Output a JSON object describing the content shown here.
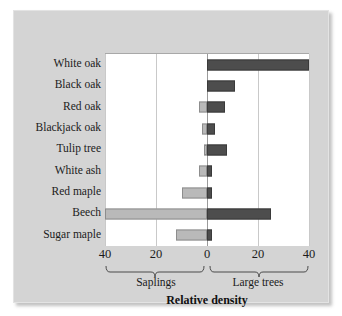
{
  "chart_data": {
    "type": "bar",
    "orientation": "horizontal",
    "subtype": "diverging-butterfly",
    "title": "",
    "xlabel": "Relative density",
    "ylabel": "",
    "xlim": [
      -40,
      40
    ],
    "grid": true,
    "legend_position": "none",
    "categories": [
      "White oak",
      "Black oak",
      "Red oak",
      "Blackjack oak",
      "Tulip tree",
      "White ash",
      "Red maple",
      "Beech",
      "Sugar maple"
    ],
    "series": [
      {
        "name": "Saplings",
        "side": "left",
        "color": "#b9b9b9",
        "values": [
          0,
          0,
          3,
          2,
          1,
          3,
          10,
          40,
          12
        ]
      },
      {
        "name": "Large trees",
        "side": "right",
        "color": "#4d4d4d",
        "values": [
          40,
          11,
          7,
          3,
          8,
          2,
          2,
          25,
          2
        ]
      }
    ],
    "x_ticks": [
      {
        "label": "40",
        "value": -40
      },
      {
        "label": "20",
        "value": -20
      },
      {
        "label": "0",
        "value": 0
      },
      {
        "label": "20",
        "value": 20
      },
      {
        "label": "40",
        "value": 40
      }
    ],
    "group_braces": [
      {
        "label": "Saplings",
        "from": -40,
        "to": 0
      },
      {
        "label": "Large trees",
        "from": 0,
        "to": 40
      }
    ]
  },
  "colors": {
    "panel_background": "#d4d4d4",
    "plot_background": "#ffffff",
    "saplings_bar": "#b9b9b9",
    "large_trees_bar": "#4d4d4d",
    "gridline": "#c9c9c9",
    "zero_line": "#9a9a9a",
    "text": "#1b1b1b"
  }
}
